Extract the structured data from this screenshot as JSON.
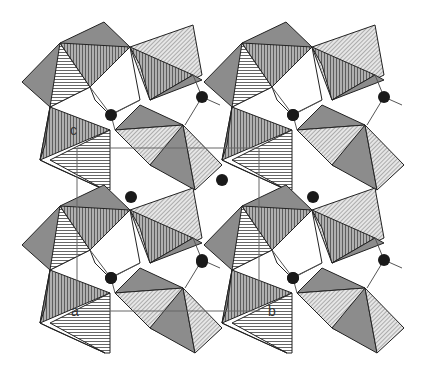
{
  "figure": {
    "colors": {
      "background": "#ffffff",
      "dark_fill": "#8c8c8c",
      "hatch_line": "#555555",
      "edge": "#222222",
      "bond": "#555555",
      "atom": "#1a1a1a",
      "cell_line": "#666666"
    },
    "axis_labels": {
      "c": "c",
      "a": "a",
      "b": "b"
    },
    "label_positions": {
      "c": {
        "x": 70,
        "y": 131
      },
      "a": {
        "x": 70,
        "y": 312
      },
      "b": {
        "x": 265,
        "y": 312
      }
    },
    "repeat_offsets": [
      [
        0,
        0
      ],
      [
        182,
        0
      ],
      [
        0,
        163
      ],
      [
        182,
        163
      ]
    ],
    "motif": {
      "polygons": [
        {
          "fill": "dark",
          "points": "22,82 60,43 104,22 130,47 90,87 50,107"
        },
        {
          "fill": "hstripe",
          "points": "60,43 90,87 50,107"
        },
        {
          "fill": "vstripe",
          "points": "60,43 130,47 90,87"
        },
        {
          "fill": "diag",
          "points": "130,47 193,25 202,75 150,100"
        },
        {
          "fill": "vstripe",
          "points": "130,47 193,75 150,100 140,65"
        },
        {
          "fill": "dark",
          "points": "150,100 193,75 202,80"
        },
        {
          "fill": "white",
          "points": "90,87 130,47 140,100 110,115 95,100"
        },
        {
          "fill": "vstripe",
          "points": "50,107 110,130 40,160"
        },
        {
          "fill": "dark",
          "points": "40,160 50,107 45,145"
        },
        {
          "fill": "hstripe",
          "points": "50,160 110,130 110,190 105,190"
        },
        {
          "fill": "dark",
          "points": "40,160 105,190 50,165"
        },
        {
          "fill": "dark",
          "points": "115,130 140,105 183,125"
        },
        {
          "fill": "diag",
          "points": "115,130 183,125 160,170 150,165"
        },
        {
          "fill": "dark",
          "points": "150,165 183,125 195,190"
        },
        {
          "fill": "diag",
          "points": "183,125 222,165 195,190"
        }
      ],
      "bonds": [
        [
          90,
          87,
          111,
          115
        ],
        [
          111,
          115,
          140,
          100
        ],
        [
          111,
          115,
          115,
          130
        ],
        [
          202,
          97,
          193,
          75
        ],
        [
          202,
          97,
          220,
          105
        ],
        [
          202,
          97,
          185,
          125
        ]
      ],
      "atoms": [
        {
          "x": 111,
          "y": 115,
          "r": 6
        },
        {
          "x": 202,
          "y": 97,
          "r": 6
        }
      ]
    },
    "unit_cell": {
      "rect1": {
        "x": 77,
        "y": 148,
        "w": 182,
        "h": 163
      },
      "vlines": [
        [
          77,
          148,
          77,
          311
        ],
        [
          259,
          148,
          259,
          311
        ]
      ],
      "hlines": [
        [
          77,
          148,
          259,
          148
        ],
        [
          77,
          311,
          259,
          311
        ]
      ]
    },
    "center_atoms": [
      {
        "x": 131,
        "y": 197,
        "r": 6
      },
      {
        "x": 222,
        "y": 180,
        "r": 6
      },
      {
        "x": 313,
        "y": 197,
        "r": 6
      },
      {
        "x": 293,
        "y": 115,
        "r": 6
      },
      {
        "x": 293,
        "y": 278,
        "r": 6
      },
      {
        "x": 111,
        "y": 278,
        "r": 6
      },
      {
        "x": 202,
        "y": 262,
        "r": 6
      }
    ]
  }
}
